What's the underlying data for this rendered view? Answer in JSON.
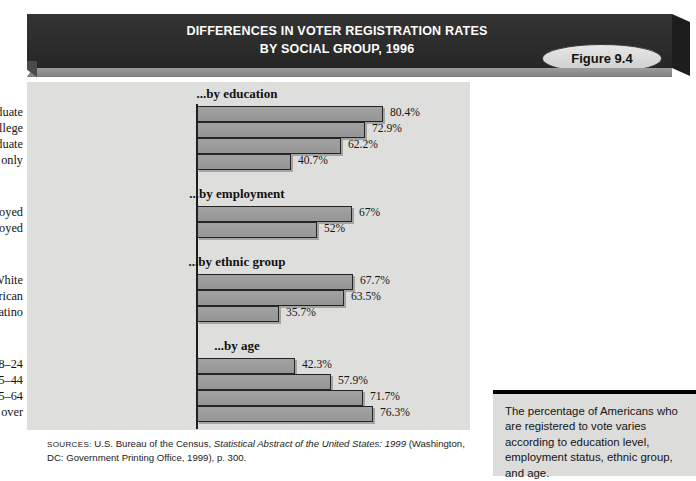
{
  "figure": {
    "badge_label": "Figure 9.4",
    "title_line1": "DIFFERENCES IN VOTER REGISTRATION RATES",
    "title_line2": "BY SOCIAL GROUP, 1996"
  },
  "sources": {
    "label": "SOURCES:",
    "text_before": " U.S. Bureau of the Census, ",
    "italic_title": "Statistical Abstract of the United States: 1999",
    "text_after": " (Washington, DC: Government Printing Office, 1999), p. 300."
  },
  "caption": {
    "text": "The percentage of Americans who are registered to vote varies according to education level, employment status, ethnic group, and age."
  },
  "colors": {
    "banner": "#2f2f2f",
    "panel": "#dededc",
    "bar_fill": "#9a9a9a",
    "bar_stroke": "#242424",
    "caption_bg": "#dcdcda"
  },
  "chart_data": {
    "type": "bar",
    "orientation": "horizontal",
    "title": "DIFFERENCES IN VOTER REGISTRATION RATES BY SOCIAL GROUP, 1996",
    "xlabel": "",
    "ylabel": "",
    "xlim": [
      0,
      100
    ],
    "grid": false,
    "legend": "none",
    "value_suffix": "%",
    "groups": [
      {
        "name": "...by education",
        "categories": [
          "College graduate",
          "Some college",
          "High school graduate",
          "Grade school only"
        ],
        "values": [
          80.4,
          72.9,
          62.2,
          40.7
        ],
        "labels": [
          "80.4%",
          "72.9%",
          "62.2%",
          "40.7%"
        ]
      },
      {
        "name": "...by employment",
        "categories": [
          "Employed",
          "Unemployed"
        ],
        "values": [
          67,
          52
        ],
        "labels": [
          "67%",
          "52%"
        ]
      },
      {
        "name": "...by ethnic group",
        "categories": [
          "White",
          "African American",
          "Latino"
        ],
        "values": [
          67.7,
          63.5,
          35.7
        ],
        "labels": [
          "67.7%",
          "63.5%",
          "35.7%"
        ]
      },
      {
        "name": "...by age",
        "categories": [
          "18–24",
          "25–44",
          "45–64",
          "65 and over"
        ],
        "values": [
          42.3,
          57.9,
          71.7,
          76.3
        ],
        "labels": [
          "42.3%",
          "57.9%",
          "71.7%",
          "76.3%"
        ]
      }
    ]
  }
}
